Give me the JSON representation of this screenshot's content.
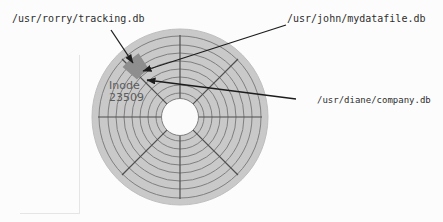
{
  "figure": {
    "file_labels": {
      "rorry": "/usr/rorry/tracking.db",
      "john": "/usr/john/mydatafile.db",
      "diane": "/usr/diane/company.db"
    },
    "inode": {
      "line1": "Inode",
      "line2": "23509"
    },
    "disk": {
      "tracks_count": 8,
      "sectors_count": 8
    },
    "colors": {
      "page-bg": "#fcfcfc",
      "platter-fill": "#c9c9c9",
      "platter-edge": "#bfbfbf",
      "track-line": "#7f7f7f",
      "spoke-line": "#4f4f4f",
      "hole-fill": "#fbfbfb",
      "block-fill": "#8e8e8e",
      "arrow-color": "#1c1c1c",
      "label-text": "#2e2e2e",
      "inode-text": "#5c5c5c",
      "ghost-border": "#e5e5e5"
    }
  }
}
